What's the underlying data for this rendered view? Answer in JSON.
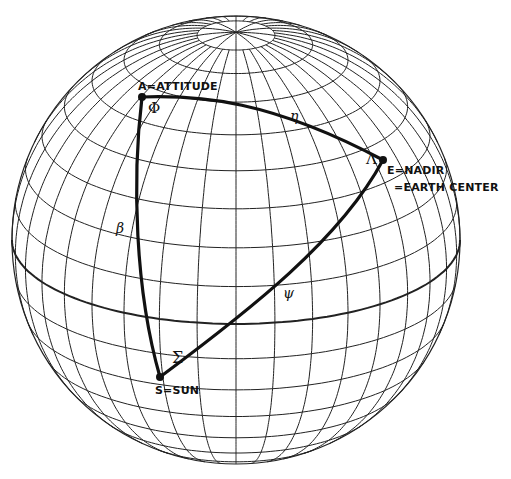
{
  "diagram": {
    "type": "celestial sphere with spherical triangle",
    "sphere": {
      "center": [
        236,
        240
      ],
      "radius": 224,
      "view_latitude_deg": 22,
      "meridian_step_deg": 10,
      "parallel_step_deg": 10,
      "grid_color": "#222222",
      "equator_bold": true
    },
    "vertices": {
      "A": {
        "label": "A=ATTITUDE",
        "pos": [
          142,
          97
        ]
      },
      "E": {
        "label_line1": "E=NADIR",
        "label_line2": "=EARTH CENTER",
        "pos": [
          383,
          160
        ]
      },
      "S": {
        "label": "S=SUN",
        "pos": [
          160,
          377
        ]
      }
    },
    "arcs": {
      "AE": {
        "symbol": "η"
      },
      "AS": {
        "symbol": "β"
      },
      "ES": {
        "symbol": "ψ"
      }
    },
    "angles": {
      "at_A": "Φ",
      "at_E": "Λ",
      "at_S": "Σ"
    },
    "line_color": "#111111"
  }
}
